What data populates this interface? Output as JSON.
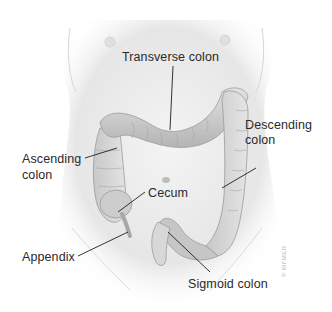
{
  "figure": {
    "labels": {
      "transverse_colon": "Transverse colon",
      "descending_colon_line1": "Descending",
      "descending_colon_line2": "colon",
      "ascending_colon_line1": "Ascending",
      "ascending_colon_line2": "colon",
      "cecum": "Cecum",
      "appendix": "Appendix",
      "sigmoid_colon": "Sigmoid colon"
    },
    "copyright": "© MFMER",
    "colors": {
      "background": "#ffffff",
      "skin": "#e9e9e9",
      "colon": "#cfcfcf",
      "colon_shadow": "#9a9a9a",
      "label_text": "#2a2a2a",
      "leader_line": "#1e1e1e"
    }
  }
}
